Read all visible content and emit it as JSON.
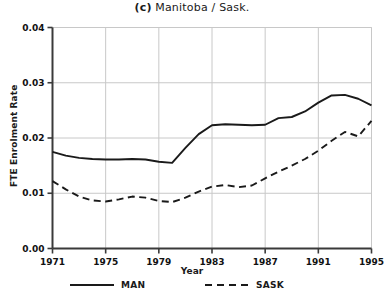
{
  "chart_data": {
    "type": "line",
    "title": "(c)  Manitoba / Sask.",
    "title_panel": "(c)",
    "title_text": "Manitoba / Sask.",
    "xlabel": "Year",
    "ylabel": "FTE Enrolment Rate",
    "xlim": [
      1971,
      1995
    ],
    "ylim": [
      0.0,
      0.04
    ],
    "grid": true,
    "legend_position": "below",
    "xticks": [
      1971,
      1975,
      1979,
      1983,
      1987,
      1991,
      1995
    ],
    "xtick_labels": [
      "1971",
      "1975",
      "1979",
      "1983",
      "1987",
      "1991",
      "1995"
    ],
    "yticks": [
      0.0,
      0.01,
      0.02,
      0.03,
      0.04
    ],
    "ytick_labels": [
      "0.00",
      "0.01",
      "0.02",
      "0.03",
      "0.04"
    ],
    "x": [
      1971,
      1972,
      1973,
      1974,
      1975,
      1976,
      1977,
      1978,
      1979,
      1980,
      1981,
      1982,
      1983,
      1984,
      1985,
      1986,
      1987,
      1988,
      1989,
      1990,
      1991,
      1992,
      1993,
      1994,
      1995
    ],
    "series": [
      {
        "name": "MAN",
        "label": "MAN",
        "style": "solid",
        "color": "#1a1a1a",
        "values": [
          0.0175,
          0.0168,
          0.0164,
          0.0162,
          0.0161,
          0.0161,
          0.0162,
          0.0161,
          0.0157,
          0.0155,
          0.0182,
          0.0207,
          0.0223,
          0.0225,
          0.0224,
          0.0223,
          0.0224,
          0.0236,
          0.0238,
          0.0248,
          0.0264,
          0.0277,
          0.0278,
          0.0271,
          0.0259
        ]
      },
      {
        "name": "SASK",
        "label": "SASK",
        "style": "dashed",
        "color": "#1a1a1a",
        "values": [
          0.0122,
          0.0107,
          0.0094,
          0.0087,
          0.0085,
          0.0089,
          0.0094,
          0.0092,
          0.0086,
          0.0084,
          0.0092,
          0.0103,
          0.0112,
          0.0115,
          0.0111,
          0.0114,
          0.0127,
          0.0139,
          0.015,
          0.0162,
          0.0177,
          0.0195,
          0.0211,
          0.0203,
          0.0231
        ]
      }
    ]
  },
  "legend": {
    "entries": [
      {
        "label": "MAN",
        "style": "solid"
      },
      {
        "label": "SASK",
        "style": "dashed"
      }
    ]
  },
  "colors": {
    "line": "#1a1a1a",
    "grid": "#c8c8c8",
    "axis": "#3a3a3a",
    "background": "#ffffff"
  }
}
